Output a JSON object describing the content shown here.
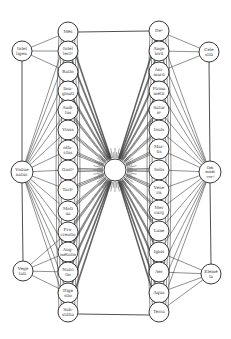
{
  "colors": {
    "ink": "#222222",
    "paper": "#ffffff"
  },
  "center": {
    "label": "",
    "icon": "sun-icon",
    "x": 115,
    "y": 170,
    "r": 11
  },
  "left_column": {
    "x": 68,
    "nodes": [
      {
        "id": "L1",
        "lines": [
          "Mēs"
        ],
        "y": 32
      },
      {
        "id": "L2",
        "lines": [
          "Intel",
          "lectꝰ"
        ],
        "y": 51
      },
      {
        "id": "L3",
        "lines": [
          "Ratio"
        ],
        "y": 72
      },
      {
        "id": "L4",
        "lines": [
          "Ima-",
          "ginati"
        ],
        "y": 91
      },
      {
        "id": "L5",
        "lines": [
          "Audi-",
          "tus"
        ],
        "y": 110
      },
      {
        "id": "L6",
        "lines": [
          "Visus"
        ],
        "y": 130
      },
      {
        "id": "L7",
        "lines": [
          "olfa-",
          "ctus"
        ],
        "y": 150
      },
      {
        "id": "L8",
        "lines": [
          "Gustꝰ"
        ],
        "y": 170
      },
      {
        "id": "L9",
        "lines": [
          "Tactꝰ"
        ],
        "y": 190
      },
      {
        "id": "L10",
        "lines": [
          "Moti",
          "ua"
        ],
        "y": 211
      },
      {
        "id": "L11",
        "lines": [
          "Pro-",
          "creatio"
        ],
        "y": 232
      },
      {
        "id": "L12",
        "lines": [
          "Aug-",
          "mētatio"
        ],
        "y": 252
      },
      {
        "id": "L13",
        "lines": [
          "Nutri",
          "tio"
        ],
        "y": 272
      },
      {
        "id": "L14",
        "lines": [
          "Dige",
          "stio"
        ],
        "y": 293
      },
      {
        "id": "L15",
        "lines": [
          "Sub-",
          "stātia"
        ],
        "y": 312
      }
    ]
  },
  "right_column": {
    "x": 159,
    "nodes": [
      {
        "id": "R1",
        "lines": [
          "Deꝰ"
        ],
        "y": 31
      },
      {
        "id": "R2",
        "lines": [
          "Ange",
          "lorū"
        ],
        "y": 51
      },
      {
        "id": "R3",
        "lines": [
          "Ani-",
          "marū"
        ],
        "y": 72
      },
      {
        "id": "R4",
        "lines": [
          "Firma",
          "mētū"
        ],
        "y": 91
      },
      {
        "id": "R5",
        "lines": [
          "Satur",
          "nꝰ"
        ],
        "y": 110
      },
      {
        "id": "R6",
        "lines": [
          "Iouis"
        ],
        "y": 130
      },
      {
        "id": "R7",
        "lines": [
          "Mar-",
          "tis"
        ],
        "y": 149
      },
      {
        "id": "R8",
        "lines": [
          "Solis"
        ],
        "y": 170
      },
      {
        "id": "R9",
        "lines": [
          "Vene",
          "ris"
        ],
        "y": 190
      },
      {
        "id": "R10",
        "lines": [
          "Mer",
          "curij"
        ],
        "y": 210
      },
      {
        "id": "R11",
        "lines": [
          "Lune"
        ],
        "y": 231
      },
      {
        "id": "R12",
        "lines": [
          "Ignis"
        ],
        "y": 252
      },
      {
        "id": "R13",
        "lines": [
          "Aer"
        ],
        "y": 272
      },
      {
        "id": "R14",
        "lines": [
          "Aqua"
        ],
        "y": 293
      },
      {
        "id": "R15",
        "lines": [
          "Terra"
        ],
        "y": 312
      }
    ]
  },
  "side_nodes": [
    {
      "id": "SL1",
      "lines": [
        "Intel",
        "ligen."
      ],
      "x": 22,
      "y": 51,
      "r": 10,
      "links": [
        "L1",
        "L2",
        "L3"
      ]
    },
    {
      "id": "SL2",
      "lines": [
        "Vnāue",
        "natur."
      ],
      "x": 22,
      "y": 172,
      "r": 11,
      "links": [
        "L1",
        "L2",
        "L3",
        "L4",
        "L5",
        "L6",
        "L7",
        "L8",
        "L9",
        "L10",
        "L11",
        "L12",
        "L13",
        "L14",
        "L15"
      ]
    },
    {
      "id": "SL3",
      "lines": [
        "Vege",
        "tati."
      ],
      "x": 23,
      "y": 271,
      "r": 10,
      "links": [
        "L11",
        "L12",
        "L13",
        "L14"
      ]
    },
    {
      "id": "SR1",
      "lines": [
        "Cele",
        "stiū"
      ],
      "x": 209,
      "y": 52,
      "r": 10,
      "links": [
        "R1",
        "R2",
        "R3"
      ]
    },
    {
      "id": "SR2",
      "lines": [
        "Om̄",
        "mūdi",
        "corꝰ"
      ],
      "x": 210,
      "y": 172,
      "r": 11,
      "links": [
        "R1",
        "R2",
        "R3",
        "R4",
        "R5",
        "R6",
        "R7",
        "R8",
        "R9",
        "R10",
        "R11",
        "R12",
        "R13",
        "R14",
        "R15"
      ]
    },
    {
      "id": "SR3",
      "lines": [
        "Elemē",
        "ta"
      ],
      "x": 211,
      "y": 274,
      "r": 10,
      "links": [
        "R12",
        "R13",
        "R14",
        "R15"
      ]
    }
  ],
  "node_radius": 10,
  "frame": {
    "top_y": 28,
    "bottom_y": 318
  }
}
